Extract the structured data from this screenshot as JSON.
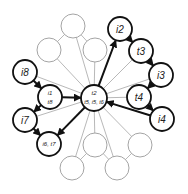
{
  "diagram": {
    "type": "graph",
    "colors": {
      "strong": "#111111",
      "faint": "#9a9a9a",
      "background": "#ffffff"
    },
    "center": {
      "id": "center",
      "x": 94,
      "y": 98,
      "r": 13,
      "line1": "t2",
      "line2": "t5, i5, t6"
    },
    "strong_nodes": [
      {
        "id": "i2",
        "x": 120,
        "y": 29,
        "label": "i2"
      },
      {
        "id": "t3",
        "x": 141,
        "y": 51,
        "label": "t3"
      },
      {
        "id": "i3",
        "x": 161,
        "y": 75,
        "label": "i3"
      },
      {
        "id": "t4",
        "x": 139,
        "y": 97,
        "label": "t4"
      },
      {
        "id": "i4",
        "x": 162,
        "y": 119,
        "label": "i4"
      },
      {
        "id": "i8",
        "x": 25,
        "y": 72,
        "label": "i8"
      },
      {
        "id": "i1t8",
        "x": 50,
        "y": 97,
        "label": "i1",
        "label2": "t8"
      },
      {
        "id": "i7",
        "x": 25,
        "y": 120,
        "label": "i7"
      },
      {
        "id": "i6t7",
        "x": 49,
        "y": 144,
        "label": "i6, t7"
      }
    ],
    "faint_nodes": [
      {
        "id": "e1",
        "x": 73,
        "y": 26
      },
      {
        "id": "e2",
        "x": 49,
        "y": 50
      },
      {
        "id": "e3",
        "x": 95,
        "y": 50
      },
      {
        "id": "e4",
        "x": 95,
        "y": 145
      },
      {
        "id": "e5",
        "x": 140,
        "y": 145
      },
      {
        "id": "e6",
        "x": 72,
        "y": 168
      },
      {
        "id": "e7",
        "x": 117,
        "y": 168
      }
    ]
  }
}
